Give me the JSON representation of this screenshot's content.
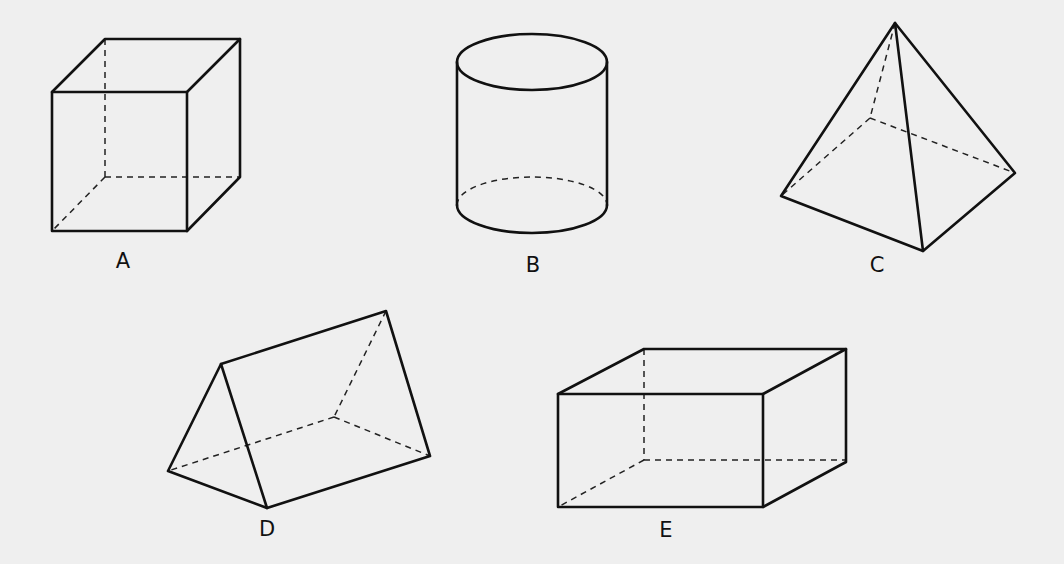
{
  "figure": {
    "shapes": [
      {
        "label": "A",
        "name": "cube"
      },
      {
        "label": "B",
        "name": "cylinder"
      },
      {
        "label": "C",
        "name": "square pyramid"
      },
      {
        "label": "D",
        "name": "triangular prism"
      },
      {
        "label": "E",
        "name": "rectangular prism"
      }
    ]
  }
}
